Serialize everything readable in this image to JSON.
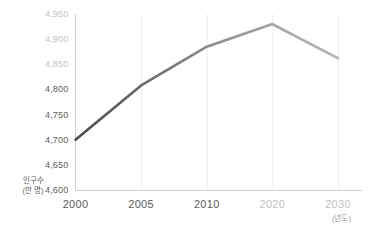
{
  "chart_data": {
    "type": "line",
    "title": "",
    "xlabel": "(년도)",
    "ylabel": "인구수\n(만 명)",
    "ylabel_line1": "인구수",
    "ylabel_line2": "(만 명)",
    "categories": [
      "2000",
      "2005",
      "2010",
      "2020",
      "2030"
    ],
    "x": [
      2000,
      2005,
      2010,
      2020,
      2030
    ],
    "values": [
      4700,
      4808,
      4885,
      4930,
      4862
    ],
    "series": [
      {
        "name": "인구수",
        "values": [
          4700,
          4808,
          4885,
          4930,
          4862
        ]
      }
    ],
    "ylim": [
      4600,
      4950
    ],
    "ytick_values": [
      4600,
      4650,
      4700,
      4750,
      4800,
      4850,
      4900,
      4950
    ],
    "ytick_labels": [
      "4,600",
      "4,650",
      "4,700",
      "4,750",
      "4,800",
      "4,850",
      "4,900",
      "4,950"
    ],
    "ytick_styles": [
      "dark",
      "dark",
      "dark",
      "dark",
      "dark",
      "light",
      "light",
      "light"
    ],
    "xtick_labels": [
      "2000",
      "2005",
      "2010",
      "2020",
      "2030"
    ],
    "xtick_styles": [
      "dark",
      "dark",
      "dark",
      "light",
      "light"
    ],
    "grid": true,
    "grid_orientation": "vertical",
    "legend": "none",
    "annotations": [],
    "colors": {
      "line_start": "#4a4a4a",
      "line_end": "#b8b8b8",
      "axis": "#cfcfcf",
      "grid": "#ededed",
      "tick_dark": "#5b5b5b",
      "tick_light": "#c2c2c2",
      "background": "#ffffff"
    }
  }
}
